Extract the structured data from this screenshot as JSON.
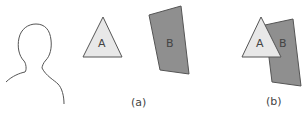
{
  "figure": {
    "panel_a": {
      "caption": "(a)",
      "shape_a": {
        "label": "A",
        "fill": "#e8e8e8"
      },
      "shape_b": {
        "label": "B",
        "fill": "#8f8f8f"
      }
    },
    "panel_b": {
      "caption": "(b)",
      "shape_a": {
        "label": "A",
        "fill": "#e8e8e8"
      },
      "shape_b": {
        "label": "B",
        "fill": "#8f8f8f"
      }
    },
    "stroke": "#555555"
  }
}
